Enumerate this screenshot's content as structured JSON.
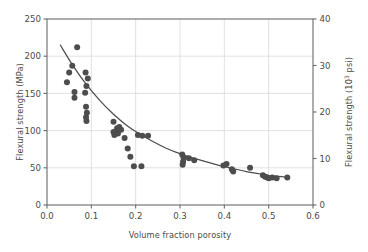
{
  "figure": {
    "background_color": "#ffffff",
    "plot_frame_color": "#6b6b6b",
    "gridline_color": "#d9d9d9",
    "point_color": "#4d4d4d",
    "curve_color": "#4d4d4d"
  },
  "chart_data": {
    "type": "scatter",
    "title": "",
    "subtitle": "",
    "xlabel": "Volume fraction porosity",
    "ylabel": "Flexural strength (MPa)",
    "y2label": "Flexural strength (10³ psi)",
    "ylabel_secondary_base": "Flexural strength (10",
    "ylabel_secondary_exp": "3",
    "ylabel_secondary_tail": " psi)",
    "xlim": [
      0.0,
      0.6
    ],
    "ylim": [
      0,
      250
    ],
    "y2lim": [
      0,
      40
    ],
    "xticks": [
      0.0,
      0.1,
      0.2,
      0.3,
      0.4,
      0.5,
      0.6
    ],
    "xtick_labels": [
      "0.0",
      "0.1",
      "0.2",
      "0.3",
      "0.4",
      "0.5",
      "0.6"
    ],
    "yticks": [
      0,
      50,
      100,
      150,
      200,
      250
    ],
    "ytick_labels": [
      "0",
      "50",
      "100",
      "150",
      "200",
      "250"
    ],
    "y2ticks": [
      0,
      10,
      20,
      30,
      40
    ],
    "y2tick_labels": [
      "0",
      "10",
      "20",
      "30",
      "40"
    ],
    "grid": true,
    "grid_axis": "both",
    "legend": false,
    "legend_position": "none",
    "marker": "circle",
    "marker_size": 3.0,
    "points": [
      [
        0.068,
        212
      ],
      [
        0.057,
        187
      ],
      [
        0.05,
        178
      ],
      [
        0.045,
        165
      ],
      [
        0.062,
        152
      ],
      [
        0.062,
        144
      ],
      [
        0.087,
        178
      ],
      [
        0.092,
        170
      ],
      [
        0.089,
        160
      ],
      [
        0.086,
        151
      ],
      [
        0.088,
        132
      ],
      [
        0.09,
        124
      ],
      [
        0.088,
        118
      ],
      [
        0.089,
        113
      ],
      [
        0.15,
        112
      ],
      [
        0.158,
        103
      ],
      [
        0.15,
        98
      ],
      [
        0.163,
        105
      ],
      [
        0.167,
        101
      ],
      [
        0.16,
        96
      ],
      [
        0.152,
        94
      ],
      [
        0.175,
        90
      ],
      [
        0.182,
        76
      ],
      [
        0.205,
        94
      ],
      [
        0.215,
        93
      ],
      [
        0.228,
        93
      ],
      [
        0.188,
        65
      ],
      [
        0.196,
        52
      ],
      [
        0.213,
        52
      ],
      [
        0.305,
        68
      ],
      [
        0.308,
        64
      ],
      [
        0.307,
        58
      ],
      [
        0.306,
        54
      ],
      [
        0.32,
        63
      ],
      [
        0.332,
        60
      ],
      [
        0.398,
        53
      ],
      [
        0.405,
        55
      ],
      [
        0.417,
        48
      ],
      [
        0.42,
        45
      ],
      [
        0.458,
        50
      ],
      [
        0.487,
        40
      ],
      [
        0.492,
        38
      ],
      [
        0.497,
        37
      ],
      [
        0.5,
        36
      ],
      [
        0.508,
        37
      ],
      [
        0.518,
        36
      ],
      [
        0.542,
        37
      ]
    ],
    "fit_curve": {
      "label": "exponential fit",
      "points": [
        [
          0.03,
          215
        ],
        [
          0.06,
          186
        ],
        [
          0.09,
          161
        ],
        [
          0.12,
          140
        ],
        [
          0.15,
          122
        ],
        [
          0.18,
          107
        ],
        [
          0.21,
          95
        ],
        [
          0.24,
          85
        ],
        [
          0.27,
          76
        ],
        [
          0.3,
          69
        ],
        [
          0.33,
          63
        ],
        [
          0.36,
          58
        ],
        [
          0.39,
          53
        ],
        [
          0.42,
          49
        ],
        [
          0.45,
          45
        ],
        [
          0.48,
          42
        ],
        [
          0.51,
          39
        ],
        [
          0.545,
          37
        ]
      ]
    }
  }
}
